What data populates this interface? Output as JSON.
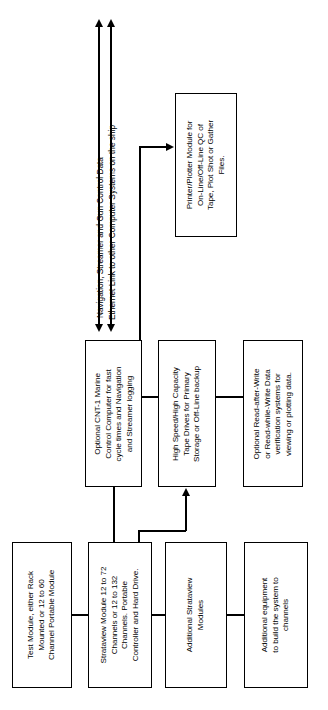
{
  "diagram": {
    "orientation": "rotated-90",
    "line_color": "#000000",
    "background_color": "#ffffff",
    "boxes": [
      {
        "id": "test-module",
        "label": "Test Module, either Rack\nMounted or 12 to 60\nChannel Portable Module"
      },
      {
        "id": "strataview-module",
        "label": "Strataview Module 12 to 72\nChannels or 12 to 132\nChannels. Portable\nController and Hard Drive."
      },
      {
        "id": "additional-strataview-modules",
        "label": "Additional Strataview\nModules"
      },
      {
        "id": "additional-equipment",
        "label": "Additional equipment\nto build the system to\nchannels"
      },
      {
        "id": "cnt-1-control-computer",
        "label": "Optional CNT-1 Marine\nControl Computer for fast\ncycle times and Navigation\nand Streamer logging"
      },
      {
        "id": "tape-drives",
        "label": "High Speed/High Capacity\nTape Drives for Primary\nStorage or Off-Line backup"
      },
      {
        "id": "data-verification",
        "label": "Optional Read-after-Write\nor Read-while-Write Data\nverification systems for\nviewing or plotting data."
      },
      {
        "id": "printer-plotter",
        "label": "Printer/Plotter Module for\nOn-Line/Off-Line QC of\nTape, Plot Shot or Gather\nFiles."
      }
    ],
    "arrow_labels": [
      {
        "id": "nav-streamer-gun",
        "text": "Navigation, Streamer and Gun Control Data"
      },
      {
        "id": "ethernet-link",
        "text": "Ethernet Link to other Computer Systems on the ship"
      }
    ]
  }
}
